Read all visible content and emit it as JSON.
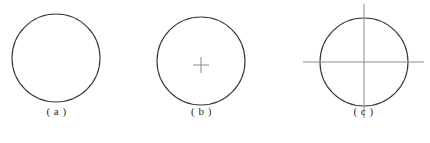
{
  "figure": {
    "canvas": {
      "width": 430,
      "height": 143
    },
    "background_color": "#ffffff",
    "stroke_color": "#3a3a3a",
    "centerline_color": "#8a8a8a",
    "caption_color": "#2b2b2b"
  },
  "panels": [
    {
      "id": "a",
      "caption": "( a )",
      "description": "plain circle with no centre mark",
      "circle": {
        "cx": 56,
        "cy": 58,
        "r": 44
      },
      "center_mark": "none",
      "caption_x": 56,
      "caption_y": 112
    },
    {
      "id": "b",
      "caption": "( b )",
      "description": "circle with small centre cross mark",
      "circle": {
        "cx": 201,
        "cy": 61,
        "r": 44
      },
      "center_mark": "small-cross",
      "cross": {
        "cx": 201,
        "cy": 65,
        "half_length": 8
      },
      "caption_x": 201,
      "caption_y": 112
    },
    {
      "id": "c",
      "caption": "( c )",
      "description": "circle with full centre lines extending beyond the circle",
      "circle": {
        "cx": 364,
        "cy": 62,
        "r": 44
      },
      "center_mark": "full-centerlines",
      "centerlines": {
        "horizontal": {
          "x1": 303,
          "x2": 424,
          "y": 62
        },
        "vertical": {
          "y1": 4,
          "y2": 118,
          "x": 364
        }
      },
      "caption_x": 364,
      "caption_y": 112
    }
  ]
}
